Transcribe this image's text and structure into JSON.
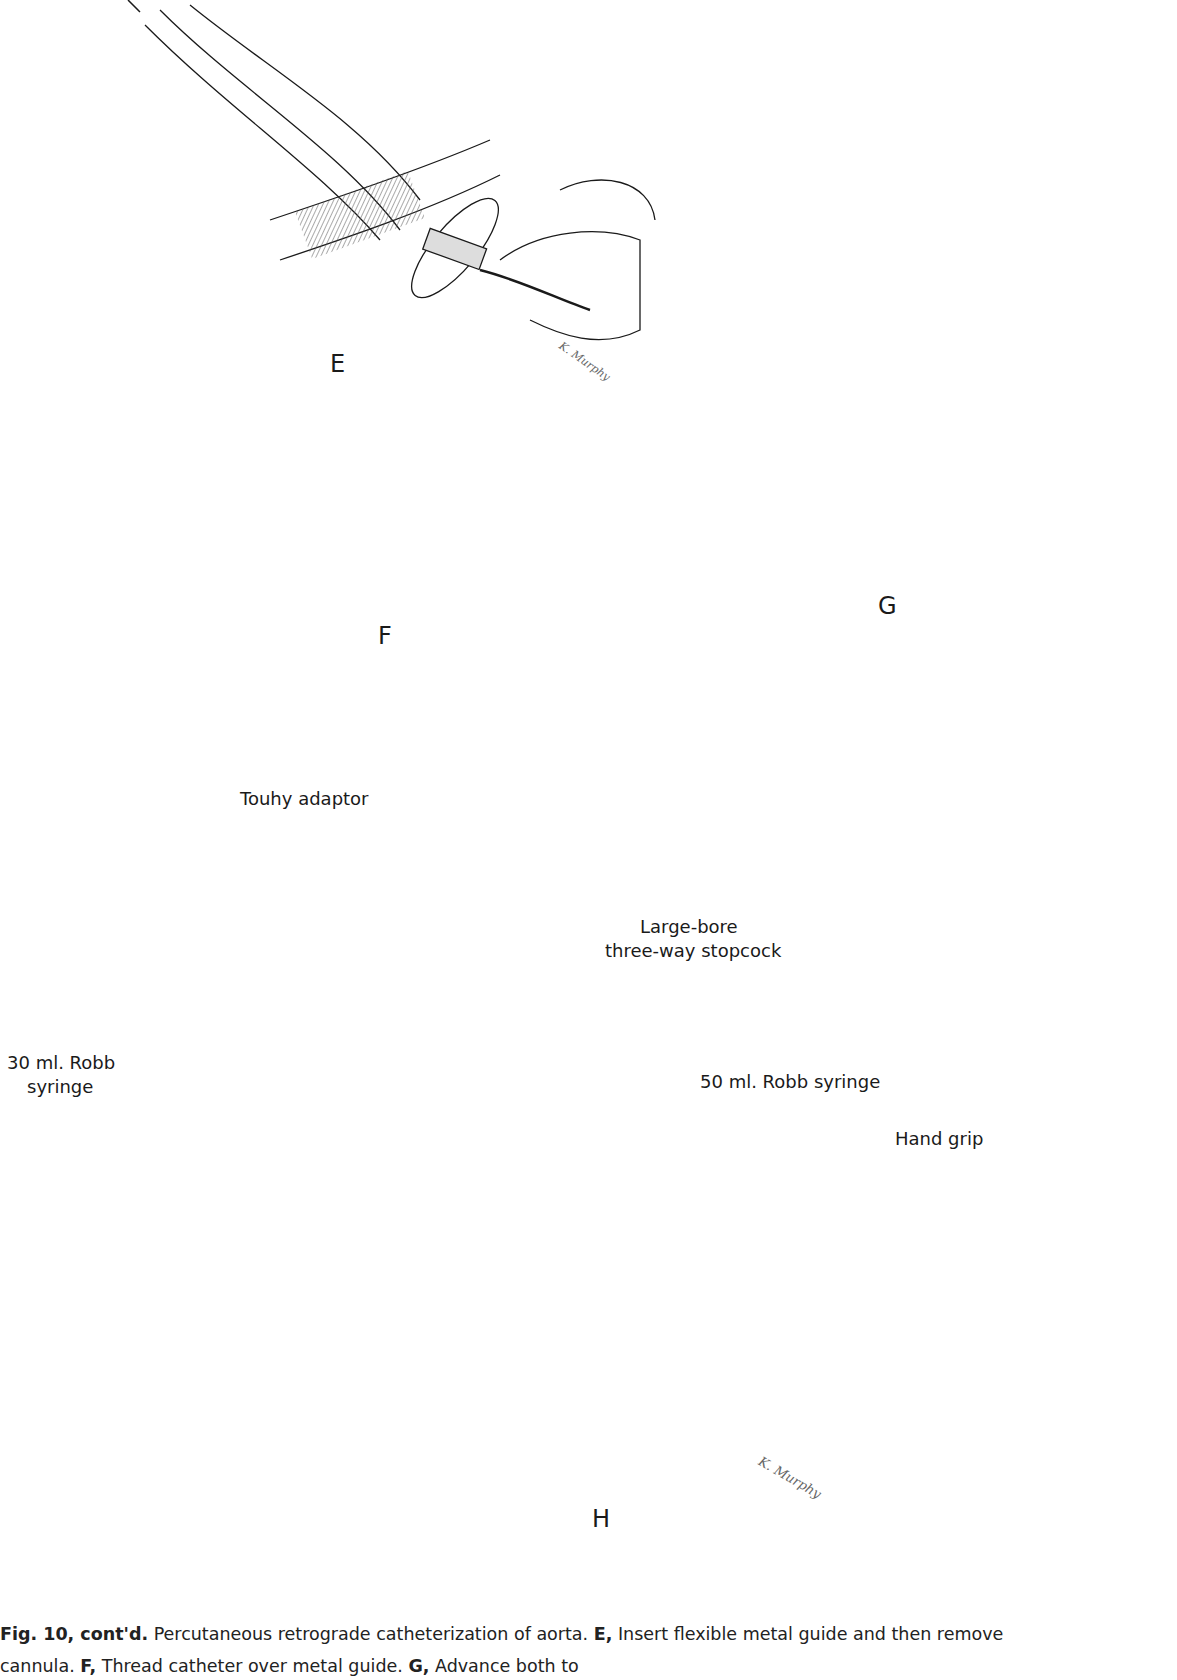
{
  "figure": {
    "panels": [
      "E",
      "F",
      "G",
      "H"
    ],
    "labels": {
      "touhy": "Touhy adaptor",
      "stopcock_line1": "Large-bore",
      "stopcock_line2": "three-way stopcock",
      "syringe30_line1": "30 ml. Robb",
      "syringe30_line2": "syringe",
      "syringe50": "50 ml. Robb syringe",
      "hand_grip": "Hand grip"
    },
    "signature": "K. Murphy",
    "colors": {
      "ink": "#1a1a1a",
      "shade": "#bdbdbd",
      "dark": "#2a2a2a"
    }
  },
  "caption": {
    "fig_ref": "Fig. 10, cont'd.",
    "text1": " Percutaneous retrograde catheterization of aorta. ",
    "e_ref": "E,",
    "e_text": " Insert flexible metal guide and then remove cannula. ",
    "f_ref": "F,",
    "f_text": " Thread catheter over metal guide. ",
    "g_ref": "G,",
    "g_text": " Advance both to"
  }
}
